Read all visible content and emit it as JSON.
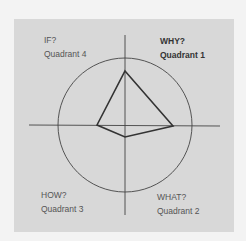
{
  "diagram": {
    "type": "quadrant-radar",
    "quadrants": [
      {
        "id": 1,
        "question": "WHY?",
        "name": "Quadrant 1",
        "position": "top-right",
        "emphasized": true
      },
      {
        "id": 2,
        "question": "WHAT?",
        "name": "Quadrant 2",
        "position": "bottom-right",
        "emphasized": false
      },
      {
        "id": 3,
        "question": "HOW?",
        "name": "Quadrant 3",
        "position": "bottom-left",
        "emphasized": false
      },
      {
        "id": 4,
        "question": "IF?",
        "name": "Quadrant 4",
        "position": "top-left",
        "emphasized": false
      }
    ],
    "shape": {
      "description": "Quadrilateral profile plotted on axes",
      "vertices": {
        "top": [
          125,
          71
        ],
        "right": [
          173,
          126
        ],
        "bottom": [
          125,
          137
        ],
        "left": [
          97,
          125
        ]
      }
    },
    "colors": {
      "frame_bg": "#d8d8d8",
      "page_bg": "#f3f3f3",
      "line": "#333333"
    }
  },
  "labels": {
    "q1_question": "WHY?",
    "q1_name": "Quadrant 1",
    "q2_question": "WHAT?",
    "q2_name": "Quadrant 2",
    "q3_question": "HOW?",
    "q3_name": "Quadrant 3",
    "q4_question": "IF?",
    "q4_name": "Quadrant 4"
  }
}
